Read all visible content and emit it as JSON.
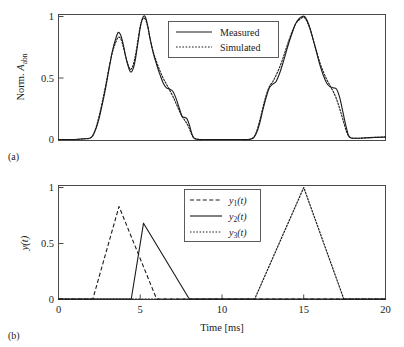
{
  "figure": {
    "panel_a_tag": "(a)",
    "panel_b_tag": "(b)"
  },
  "panel_a": {
    "ylabel_main": "Norm. ",
    "ylabel_symbol": "A",
    "ylabel_subscript": "abn",
    "ytick_labels": [
      "1",
      "0.5",
      "0"
    ],
    "legend": [
      {
        "label": "Measured",
        "style": "solid"
      },
      {
        "label": "Simulated",
        "style": "dotted"
      }
    ]
  },
  "panel_b": {
    "ylabel_symbol": "y",
    "ylabel_arg": "(t)",
    "xlabel": "Time [ms]",
    "ytick_labels": [
      "1",
      "0.5",
      "0"
    ],
    "xtick_labels": [
      "0",
      "5",
      "10",
      "15",
      "20"
    ],
    "legend": [
      {
        "label_symbol": "y",
        "label_sub": "1",
        "label_arg": "(t)",
        "style": "dashed"
      },
      {
        "label_symbol": "y",
        "label_sub": "2",
        "label_arg": "(t)",
        "style": "solid"
      },
      {
        "label_symbol": "y",
        "label_sub": "3",
        "label_arg": "(t)",
        "style": "dotted"
      }
    ]
  },
  "chart_data": [
    {
      "type": "line",
      "panel": "(a)",
      "title": "",
      "xlabel": "",
      "ylabel": "Norm. A_abn",
      "xlim": [
        0,
        20
      ],
      "ylim": [
        -0.03,
        1.08
      ],
      "grid": false,
      "legend_position": "top-center",
      "yticks": [
        0,
        0.5,
        1
      ],
      "series": [
        {
          "name": "Measured",
          "style": "solid",
          "x": [
            0.0,
            0.5,
            1.0,
            1.5,
            1.9,
            2.1,
            2.3,
            2.5,
            2.7,
            2.9,
            3.1,
            3.3,
            3.5,
            3.65,
            3.8,
            3.95,
            4.1,
            4.25,
            4.4,
            4.55,
            4.7,
            4.85,
            5.0,
            5.15,
            5.3,
            5.45,
            5.6,
            5.8,
            6.0,
            6.2,
            6.4,
            6.6,
            6.8,
            7.0,
            7.2,
            7.4,
            7.55,
            7.7,
            7.85,
            8.0,
            8.15,
            8.3,
            8.6,
            9.0,
            10.0,
            11.0,
            11.6,
            11.9,
            12.1,
            12.3,
            12.5,
            12.7,
            12.9,
            13.1,
            13.3,
            13.5,
            13.7,
            13.9,
            14.1,
            14.3,
            14.5,
            14.7,
            14.9,
            15.05,
            15.2,
            15.4,
            15.6,
            15.8,
            16.0,
            16.2,
            16.4,
            16.6,
            16.8,
            17.0,
            17.2,
            17.4,
            17.6,
            17.8,
            18.2,
            19.0,
            20.0
          ],
          "y": [
            0.0,
            0.0,
            0.0,
            0.005,
            0.01,
            0.03,
            0.09,
            0.18,
            0.3,
            0.43,
            0.58,
            0.72,
            0.82,
            0.87,
            0.85,
            0.78,
            0.68,
            0.6,
            0.55,
            0.57,
            0.65,
            0.78,
            0.91,
            0.99,
            1.0,
            0.93,
            0.82,
            0.7,
            0.61,
            0.53,
            0.46,
            0.42,
            0.41,
            0.39,
            0.33,
            0.25,
            0.19,
            0.18,
            0.17,
            0.12,
            0.05,
            0.01,
            0.0,
            0.0,
            0.0,
            0.0,
            0.0,
            0.01,
            0.05,
            0.13,
            0.24,
            0.34,
            0.42,
            0.45,
            0.47,
            0.53,
            0.61,
            0.7,
            0.79,
            0.87,
            0.94,
            0.98,
            1.0,
            1.0,
            0.97,
            0.9,
            0.8,
            0.7,
            0.6,
            0.52,
            0.46,
            0.43,
            0.42,
            0.41,
            0.34,
            0.22,
            0.1,
            0.02,
            0.01,
            0.015,
            0.02
          ]
        },
        {
          "name": "Simulated",
          "style": "dotted",
          "x": [
            0.0,
            0.5,
            1.0,
            1.5,
            1.9,
            2.1,
            2.3,
            2.5,
            2.7,
            2.9,
            3.1,
            3.3,
            3.5,
            3.65,
            3.8,
            3.95,
            4.1,
            4.25,
            4.4,
            4.55,
            4.7,
            4.85,
            5.0,
            5.15,
            5.3,
            5.45,
            5.6,
            5.8,
            6.0,
            6.2,
            6.4,
            6.6,
            6.8,
            7.0,
            7.2,
            7.4,
            7.55,
            7.7,
            7.85,
            8.0,
            8.15,
            8.3,
            8.6,
            9.0,
            10.0,
            11.0,
            11.6,
            11.9,
            12.1,
            12.3,
            12.5,
            12.7,
            12.9,
            13.1,
            13.3,
            13.5,
            13.7,
            13.9,
            14.1,
            14.3,
            14.5,
            14.7,
            14.9,
            15.05,
            15.2,
            15.4,
            15.6,
            15.8,
            16.0,
            16.2,
            16.4,
            16.6,
            16.8,
            17.0,
            17.2,
            17.4,
            17.6,
            17.8,
            18.2,
            19.0,
            20.0
          ],
          "y": [
            0.0,
            0.0,
            0.0,
            0.005,
            0.01,
            0.035,
            0.1,
            0.2,
            0.32,
            0.45,
            0.59,
            0.71,
            0.79,
            0.83,
            0.82,
            0.76,
            0.68,
            0.61,
            0.57,
            0.6,
            0.68,
            0.8,
            0.92,
            0.98,
            0.98,
            0.92,
            0.82,
            0.71,
            0.63,
            0.56,
            0.5,
            0.45,
            0.4,
            0.35,
            0.29,
            0.23,
            0.19,
            0.16,
            0.13,
            0.09,
            0.04,
            0.01,
            0.0,
            0.0,
            0.0,
            0.0,
            0.0,
            0.015,
            0.06,
            0.15,
            0.26,
            0.36,
            0.43,
            0.47,
            0.52,
            0.58,
            0.65,
            0.73,
            0.81,
            0.88,
            0.94,
            0.97,
            0.99,
            0.99,
            0.96,
            0.89,
            0.8,
            0.71,
            0.62,
            0.55,
            0.49,
            0.44,
            0.39,
            0.33,
            0.25,
            0.16,
            0.07,
            0.02,
            0.01,
            0.015,
            0.02
          ]
        }
      ]
    },
    {
      "type": "line",
      "panel": "(b)",
      "title": "",
      "xlabel": "Time [ms]",
      "ylabel": "y(t)",
      "xlim": [
        0,
        20
      ],
      "ylim": [
        -0.03,
        1.08
      ],
      "grid": false,
      "legend_position": "top-center",
      "yticks": [
        0,
        0.5,
        1
      ],
      "xticks": [
        0,
        5,
        10,
        15,
        20
      ],
      "series": [
        {
          "name": "y1(t)",
          "style": "dashed",
          "peak_x": 3.7,
          "peak_y": 0.83,
          "onset_x": 2.1,
          "offset_x": 6.0,
          "x": [
            0.0,
            2.1,
            3.7,
            6.0,
            20.0
          ],
          "y": [
            0.0,
            0.0,
            0.83,
            0.0,
            0.0
          ]
        },
        {
          "name": "y2(t)",
          "style": "solid",
          "peak_x": 5.2,
          "peak_y": 0.68,
          "onset_x": 4.45,
          "offset_x": 8.0,
          "x": [
            0.0,
            4.45,
            5.2,
            8.0,
            20.0
          ],
          "y": [
            0.0,
            0.0,
            0.68,
            0.0,
            0.0
          ]
        },
        {
          "name": "y3(t)",
          "style": "dotted",
          "peak_x": 15.0,
          "peak_y": 1.0,
          "onset_x": 12.0,
          "offset_x": 17.45,
          "x": [
            0.0,
            12.0,
            15.0,
            17.45,
            20.0
          ],
          "y": [
            0.0,
            0.0,
            1.0,
            0.0,
            0.0
          ]
        }
      ]
    }
  ]
}
